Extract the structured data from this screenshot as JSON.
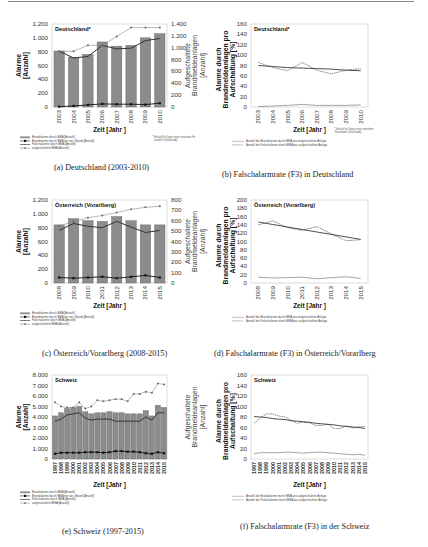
{
  "captions": {
    "a": "(a) Deutschland (2003-2010)",
    "b": "(b) Falschalarmrate (F3) in Deutschland",
    "c": "(c) Österreich/Vorarlberg (2008-2015)",
    "d": "(d) Falschalarmrate (F3) in Österreich/Vorarlberg",
    "e": "(e) Schweiz (1997-2015)",
    "f": "(f) Falschalarmrate (F3) in der Schweiz"
  },
  "chart_data": [
    {
      "id": "a",
      "type": "bar",
      "title": "Deutschland*",
      "xlabel": "Zeit [Jahr ]",
      "ylabel": "Alarme [Anzahl]",
      "ylabel_right": "Aufgeschaltete Brandmeldeanlagen [Anzahl]",
      "ylim": [
        0,
        1200
      ],
      "yticks": [
        "0",
        "200",
        "400",
        "600",
        "800",
        "1.000",
        "1.200"
      ],
      "ylim_right": [
        0,
        1400
      ],
      "yticks_right": [
        "0",
        "200",
        "400",
        "600",
        "800",
        "1.000",
        "1.200",
        "1.400"
      ],
      "categories": [
        "2003",
        "2004",
        "2005",
        "2006",
        "2007",
        "2008",
        "2009",
        "2010"
      ],
      "series": [
        {
          "name": "Brandalarme durch BMA [Anzahl]",
          "kind": "bar",
          "axis": "left",
          "values": [
            810,
            720,
            760,
            940,
            880,
            890,
            1000,
            1060
          ]
        },
        {
          "name": "Brandalarme durch BMA mit tats. Brand [Anzahl]",
          "kind": "line-square",
          "axis": "left",
          "values": [
            5,
            15,
            30,
            45,
            40,
            40,
            35,
            55
          ]
        },
        {
          "name": "Falschalarme durch BMA [Anzahl]",
          "kind": "line",
          "axis": "left",
          "values": [
            805,
            710,
            730,
            890,
            840,
            850,
            960,
            990
          ]
        },
        {
          "name": "aufgeschaltete BMA [Anzahl]",
          "kind": "line-marker",
          "axis": "right",
          "values": [
            940,
            940,
            1040,
            1040,
            1190,
            1340,
            1340,
            1340
          ]
        }
      ],
      "note": "* Verlauf für Daten einer einzelnen Feuerwehr (Großstadt)"
    },
    {
      "id": "b",
      "type": "line",
      "title": "Deutschland*",
      "xlabel": "Zeit [Jahr ]",
      "ylabel": "Alarme durch Brandmeldeanlagen pro Aufschaltung [%]",
      "ylim": [
        0,
        160
      ],
      "yticks": [
        "0",
        "20",
        "40",
        "60",
        "80",
        "100",
        "120",
        "140",
        "160"
      ],
      "categories": [
        "2003",
        "2004",
        "2005",
        "2006",
        "2007",
        "2008",
        "2009",
        "2010"
      ],
      "series": [
        {
          "name": "Anzahl der Brandalarme durch BMA pro aufgeschaltete Anlage",
          "values": [
            1,
            2,
            3,
            5,
            3,
            3,
            3,
            4
          ]
        },
        {
          "name": "Anzahl der Falschalarme durch BMA pro aufgeschaltete Anlage",
          "values": [
            86,
            76,
            70,
            86,
            71,
            64,
            71,
            74
          ]
        },
        {
          "name": "Trend Falschalarme",
          "values": [
            80,
            78,
            76,
            75,
            74,
            73,
            71,
            70
          ]
        }
      ],
      "note": "* Verlauf für Daten einer einzelnen Feuerwehr (Großstadt)"
    },
    {
      "id": "c",
      "type": "bar",
      "title": "Österreich (Vorarlberg)",
      "xlabel": "Zeit [Jahr ]",
      "ylabel": "Alarme [Anzahl]",
      "ylabel_right": "Aufgeschaltete Brandmeldeanlagen [Anzahl]",
      "ylim": [
        0,
        1200
      ],
      "yticks": [
        "0",
        "200",
        "400",
        "600",
        "800",
        "1.000",
        "1.200"
      ],
      "ylim_right": [
        0,
        800
      ],
      "yticks_right": [
        "0",
        "100",
        "200",
        "300",
        "400",
        "500",
        "600",
        "700",
        "800"
      ],
      "categories": [
        "2008",
        "2009",
        "2010",
        "2011",
        "2012",
        "2013",
        "2014",
        "2015"
      ],
      "series": [
        {
          "name": "Brandalarme durch BMA [Anzahl]",
          "kind": "bar",
          "axis": "left",
          "values": [
            840,
            930,
            900,
            890,
            960,
            900,
            840,
            840
          ]
        },
        {
          "name": "Brandalarme durch BMA mit tats. Brand [Anzahl]",
          "kind": "line-square",
          "axis": "left",
          "values": [
            80,
            70,
            80,
            90,
            70,
            90,
            110,
            80
          ]
        },
        {
          "name": "Falschalarme durch BMA [Anzahl]",
          "kind": "line",
          "axis": "left",
          "values": [
            760,
            860,
            820,
            800,
            890,
            810,
            730,
            760
          ]
        },
        {
          "name": "aufgeschaltete BMA [Anzahl]",
          "kind": "line-marker",
          "axis": "right",
          "values": [
            550,
            590,
            630,
            650,
            680,
            710,
            730,
            740
          ]
        }
      ]
    },
    {
      "id": "d",
      "type": "line",
      "title": "Österreich (Vorarlberg)",
      "xlabel": "Zeit [Jahr ]",
      "ylabel": "Alarme durch Brandmeldeanlagen pro Aufschaltung [%]",
      "ylim": [
        0,
        200
      ],
      "yticks": [
        "0",
        "20",
        "40",
        "60",
        "80",
        "100",
        "120",
        "140",
        "160",
        "180",
        "200"
      ],
      "categories": [
        "2008",
        "2009",
        "2010",
        "2011",
        "2012",
        "2013",
        "2014",
        "2015"
      ],
      "series": [
        {
          "name": "Anzahl der Brandalarme durch BMA pro aufgeschaltete Anlage",
          "values": [
            14,
            12,
            13,
            14,
            10,
            13,
            15,
            11
          ]
        },
        {
          "name": "Anzahl der Falschalarme durch BMA pro aufgeschaltete Anlage",
          "values": [
            140,
            150,
            133,
            127,
            136,
            118,
            102,
            104
          ]
        },
        {
          "name": "Trend Falschalarme",
          "values": [
            147,
            141,
            135,
            129,
            123,
            117,
            111,
            105
          ]
        }
      ]
    },
    {
      "id": "e",
      "type": "bar",
      "title": "Schweiz",
      "xlabel": "Zeit [Jahr ]",
      "ylabel": "Alarme [Anzahl]",
      "ylabel_right": "Aufgeschaltete Brandmeldeanlagen [Anzahl]",
      "ylim": [
        0,
        8000
      ],
      "yticks": [
        "0",
        "1.000",
        "2.000",
        "3.000",
        "4.000",
        "5.000",
        "6.000",
        "7.000",
        "8.000"
      ],
      "categories": [
        "1997",
        "1998",
        "1999",
        "2000",
        "2001",
        "2002",
        "2003",
        "2004",
        "2005",
        "2006",
        "2007",
        "2008",
        "2009",
        "2010",
        "2011",
        "2012",
        "2013",
        "2014",
        "2015"
      ],
      "series": [
        {
          "name": "Brandalarme durch BMA [Anzahl]",
          "kind": "bar",
          "axis": "left",
          "values": [
            4100,
            4400,
            4800,
            4900,
            5000,
            4500,
            4300,
            4400,
            4400,
            4500,
            4400,
            4400,
            4300,
            4300,
            4300,
            4600,
            4100,
            5100,
            4900
          ]
        },
        {
          "name": "Brandalarme durch BMA mit tats. Brand [Anzahl]",
          "kind": "line-square",
          "axis": "left",
          "values": [
            500,
            600,
            600,
            600,
            600,
            650,
            650,
            650,
            600,
            650,
            750,
            750,
            700,
            700,
            650,
            550,
            500,
            650,
            550
          ]
        },
        {
          "name": "Falschalarme durch BMA [Anzahl]",
          "kind": "line",
          "axis": "left",
          "values": [
            3600,
            3800,
            4200,
            4300,
            4400,
            3900,
            3700,
            3800,
            3800,
            3800,
            3600,
            3600,
            3600,
            3600,
            3600,
            4000,
            3700,
            4400,
            4400
          ]
        },
        {
          "name": "aufgeschaltete BMA [Anzahl]",
          "kind": "line-marker",
          "axis": "left",
          "values": [
            5400,
            5000,
            4900,
            4900,
            5400,
            4800,
            5000,
            5600,
            5500,
            5600,
            5700,
            5700,
            5500,
            6200,
            6200,
            6400,
            6300,
            7200,
            7100
          ]
        }
      ]
    },
    {
      "id": "f",
      "type": "line",
      "title": "Schweiz",
      "xlabel": "Zeit [Jahr ]",
      "ylabel": "Alarme durch Brandmeldeanlagen pro Aufschaltung [%]",
      "ylim": [
        0,
        160
      ],
      "yticks": [
        "0",
        "20",
        "40",
        "60",
        "80",
        "100",
        "120",
        "140",
        "160"
      ],
      "categories": [
        "1997",
        "1998",
        "1999",
        "2000",
        "2001",
        "2002",
        "2003",
        "2004",
        "2005",
        "2006",
        "2007",
        "2008",
        "2009",
        "2010",
        "2011",
        "2012",
        "2013",
        "2014",
        "2015"
      ],
      "series": [
        {
          "name": "Anzahl der Brandalarme durch BMA pro aufgeschaltete Anlage",
          "values": [
            10,
            12,
            12,
            12,
            12,
            13,
            13,
            12,
            11,
            12,
            13,
            13,
            12,
            11,
            10,
            9,
            8,
            9,
            7
          ]
        },
        {
          "name": "Anzahl der Falschalarme durch BMA pro aufgeschaltete Anlage",
          "values": [
            68,
            78,
            86,
            86,
            82,
            80,
            74,
            68,
            70,
            69,
            64,
            64,
            66,
            58,
            58,
            63,
            59,
            61,
            62
          ]
        },
        {
          "name": "Trend Falschalarme",
          "values": [
            81,
            80,
            79,
            77,
            76,
            75,
            73,
            72,
            71,
            70,
            68,
            67,
            66,
            65,
            63,
            62,
            61,
            60,
            58
          ]
        }
      ]
    }
  ]
}
